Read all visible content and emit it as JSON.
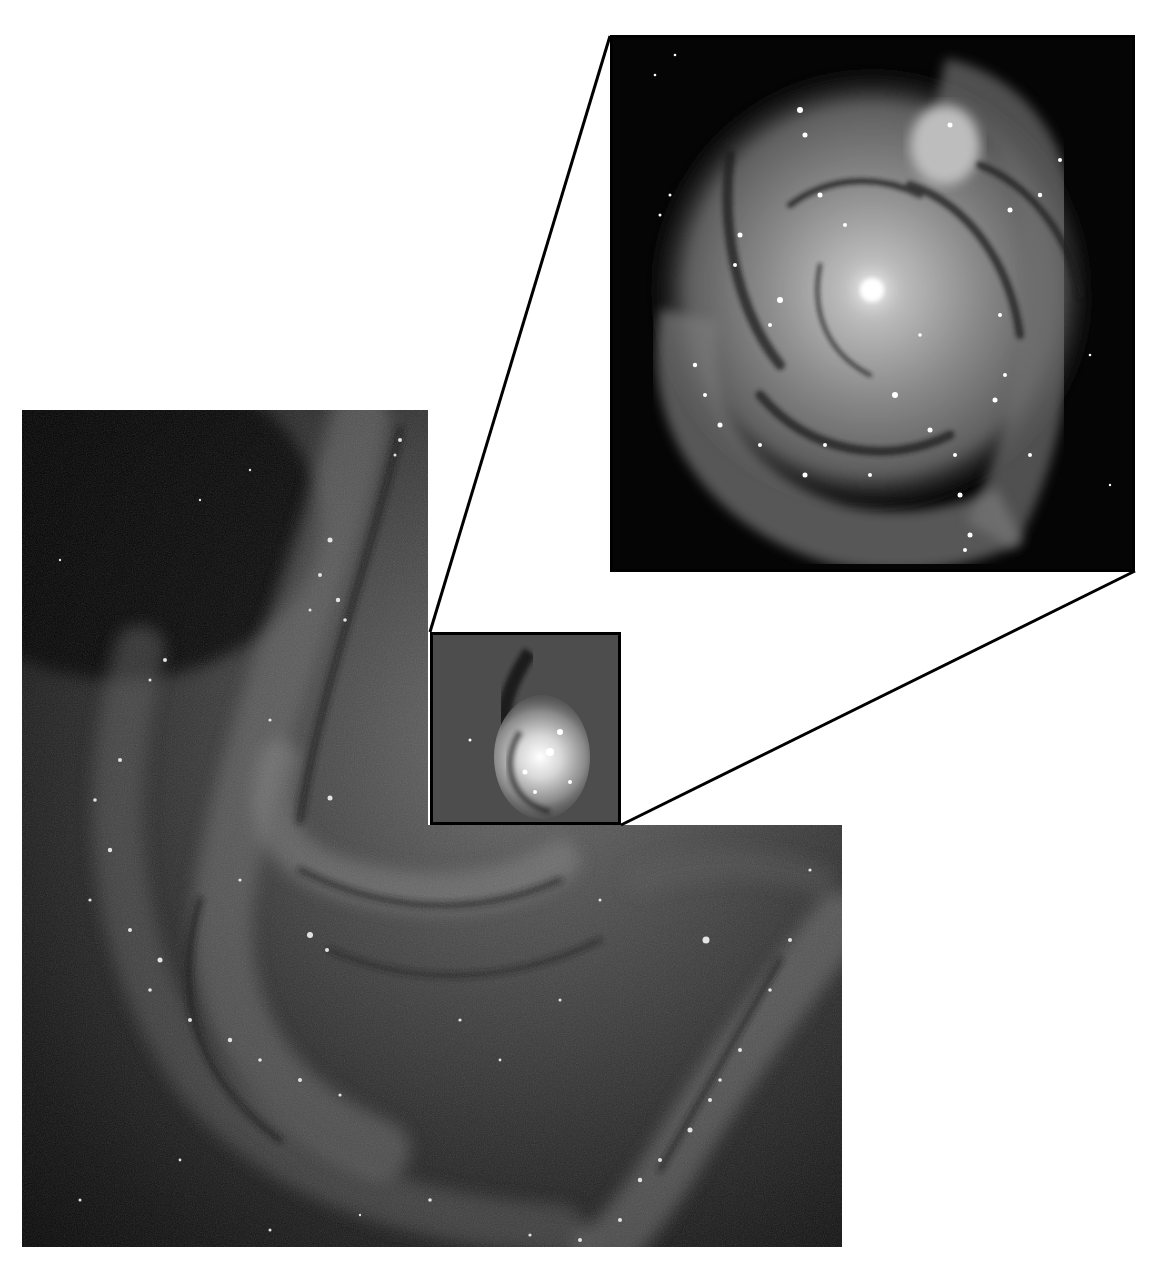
{
  "figure": {
    "background_color": "#ffffff",
    "wide_field": {
      "description": "wide-field grayscale image of spiral galaxy disk (L-shaped crop)",
      "bounds": {
        "left_column": [
          22,
          410,
          428,
          825
        ],
        "bottom_block": [
          22,
          825,
          842,
          1247
        ]
      }
    },
    "zoom_box": {
      "description": "small black-outlined box around galaxy core",
      "bounds": [
        430,
        632,
        621,
        825
      ],
      "border_color": "#000000"
    },
    "inset": {
      "description": "magnified view of galaxy core and inner spiral arms",
      "bounds": [
        610,
        35,
        1135,
        572
      ]
    },
    "connectors": [
      {
        "from": [
          430,
          632
        ],
        "to": [
          610,
          35
        ]
      },
      {
        "from": [
          621,
          825
        ],
        "to": [
          1135,
          572
        ]
      }
    ]
  }
}
